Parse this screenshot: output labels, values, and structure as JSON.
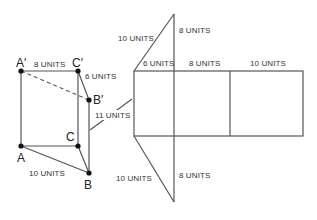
{
  "prism": {
    "vertices": {
      "A_prime": "A′",
      "C_prime": "C′",
      "B_prime": "B′",
      "A": "A",
      "B": "B",
      "C": "C"
    },
    "labels": {
      "top_edge": "8 UNITS",
      "top_right_edge": "6 UNITS",
      "height": "11 UNITS",
      "bottom_edge": "10 UNITS"
    }
  },
  "net": {
    "top_triangle": {
      "hypotenuse": "10 UNITS",
      "vertical_leg": "8 UNITS"
    },
    "rect_widths": [
      "6 UNITS",
      "8 UNITS",
      "10 UNITS"
    ],
    "bottom_triangle": {
      "hypotenuse": "10 UNITS",
      "vertical_leg": "8 UNITS"
    }
  },
  "colors": {
    "line": "#555555",
    "text": "#333333",
    "point": "#111111"
  }
}
